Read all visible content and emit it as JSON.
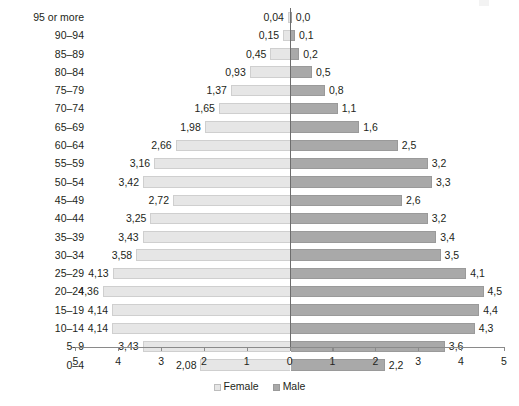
{
  "chart_data": {
    "type": "bar",
    "subtype": "population-pyramid",
    "title": "",
    "xlabel": "",
    "ylabel": "",
    "orientation": "horizontal",
    "grid": false,
    "axis_center_value": 0,
    "xlim": [
      -5,
      5
    ],
    "x_ticks_left": [
      "5",
      "4",
      "3",
      "2",
      "1"
    ],
    "x_tick_zero": "0",
    "x_ticks_right": [
      "1",
      "2",
      "3",
      "4",
      "5"
    ],
    "x_tick_labels_all": [
      "5",
      "4",
      "3",
      "2",
      "1",
      "0",
      "1",
      "2",
      "3",
      "4",
      "5"
    ],
    "legend": {
      "position": "bottom-center",
      "entries": [
        {
          "label": "Female",
          "color": "#e6e6e6"
        },
        {
          "label": "Male",
          "color": "#a9a9a9"
        }
      ]
    },
    "categories": [
      "95 or more",
      "90–94",
      "85–89",
      "80–84",
      "75–79",
      "70–74",
      "65–69",
      "60–64",
      "55–59",
      "50–54",
      "45–49",
      "40–44",
      "35–39",
      "30–34",
      "25–29",
      "20–24",
      "15–19",
      "10–14",
      "5–9",
      "0–4"
    ],
    "series": [
      {
        "name": "Female",
        "side": "left",
        "color": "#e6e6e6",
        "values": [
          0.04,
          0.15,
          0.45,
          0.93,
          1.37,
          1.65,
          1.98,
          2.66,
          3.16,
          3.42,
          2.72,
          3.25,
          3.43,
          3.58,
          4.13,
          4.36,
          4.14,
          4.14,
          3.43,
          2.08
        ],
        "labels": [
          "0,04",
          "0,15",
          "0,45",
          "0,93",
          "1,37",
          "1,65",
          "1,98",
          "2,66",
          "3,16",
          "3,42",
          "2,72",
          "3,25",
          "3,43",
          "3,58",
          "4,13",
          "4,36",
          "4,14",
          "4,14",
          "3,43",
          "2,08"
        ]
      },
      {
        "name": "Male",
        "side": "right",
        "color": "#a9a9a9",
        "values": [
          0.0,
          0.1,
          0.2,
          0.5,
          0.8,
          1.1,
          1.6,
          2.5,
          3.2,
          3.3,
          2.6,
          3.2,
          3.4,
          3.5,
          4.1,
          4.5,
          4.4,
          4.3,
          3.6,
          2.2
        ],
        "labels": [
          "0,0",
          "0,1",
          "0,2",
          "0,5",
          "0,8",
          "1,1",
          "1,6",
          "2,5",
          "3,2",
          "3,3",
          "2,6",
          "3,2",
          "3,4",
          "3,5",
          "4,1",
          "4,5",
          "4,4",
          "4,3",
          "3,6",
          "2,2"
        ]
      }
    ]
  },
  "colors": {
    "female": "#e6e6e6",
    "male": "#a9a9a9",
    "axis": "#8a8a8a",
    "center_line": "#6d6d6d",
    "text": "#231f20",
    "background": "#ffffff"
  }
}
